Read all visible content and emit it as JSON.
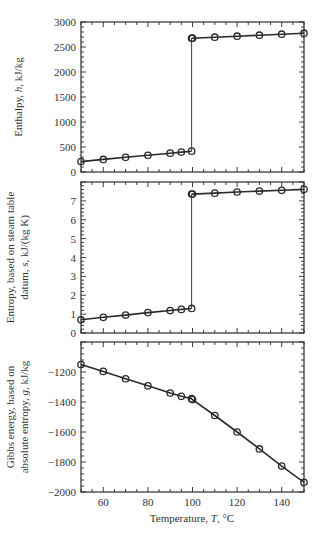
{
  "figure": {
    "xlabel": "Temperature, T, °C",
    "xlabel_parts": [
      "Temperature, ",
      "T",
      ", °C"
    ]
  },
  "chart_data": [
    {
      "type": "line",
      "title": "",
      "xlabel": "",
      "ylabel": "Enthalpy, h, kJ/kg",
      "ylabel_lines": [
        [
          "Enthalpy, ",
          "h",
          ", kJ/kg"
        ]
      ],
      "xlim": [
        50,
        150
      ],
      "ylim": [
        0,
        3000
      ],
      "yticks": [
        0,
        500,
        1000,
        1500,
        2000,
        2500,
        3000
      ],
      "xticks": [
        60,
        80,
        100,
        120,
        140
      ],
      "show_xticklabels": false,
      "grid": false,
      "marker": "open-circle",
      "series": [
        {
          "name": "liquid",
          "x": [
            50,
            60,
            70,
            80,
            90,
            95,
            99.6
          ],
          "y": [
            209,
            251,
            293,
            335,
            377,
            398,
            417
          ]
        },
        {
          "name": "transition",
          "x": [
            99.6,
            99.6
          ],
          "y": [
            417,
            2675
          ],
          "marker": "none",
          "thin": true
        },
        {
          "name": "vapor",
          "x": [
            99.6,
            100,
            110,
            120,
            130,
            140,
            150
          ],
          "y": [
            2675,
            2676,
            2696,
            2716,
            2736,
            2756,
            2776
          ]
        }
      ]
    },
    {
      "type": "line",
      "title": "",
      "xlabel": "",
      "ylabel": "Entropy, based on steam table datum, s, kJ/(kg K)",
      "ylabel_lines": [
        [
          "Entropy, based on steam table"
        ],
        [
          "datum, ",
          "s",
          ", kJ/(kg K)"
        ]
      ],
      "xlim": [
        50,
        150
      ],
      "ylim": [
        0,
        8
      ],
      "yticks": [
        0,
        1,
        2,
        3,
        4,
        5,
        6,
        7
      ],
      "xticks": [
        60,
        80,
        100,
        120,
        140
      ],
      "show_xticklabels": false,
      "grid": false,
      "marker": "open-circle",
      "series": [
        {
          "name": "liquid",
          "x": [
            50,
            60,
            70,
            80,
            90,
            95,
            99.6
          ],
          "y": [
            0.7,
            0.83,
            0.95,
            1.08,
            1.19,
            1.25,
            1.3
          ]
        },
        {
          "name": "transition",
          "x": [
            99.6,
            99.6
          ],
          "y": [
            1.3,
            7.36
          ],
          "marker": "none",
          "thin": true
        },
        {
          "name": "vapor",
          "x": [
            99.6,
            100,
            110,
            120,
            130,
            140,
            150
          ],
          "y": [
            7.36,
            7.36,
            7.41,
            7.47,
            7.52,
            7.56,
            7.61
          ]
        }
      ]
    },
    {
      "type": "line",
      "title": "",
      "xlabel": "Temperature, T, °C",
      "ylabel": "Gibbs energy, based on absolute entropy, g, kJ/kg",
      "ylabel_lines": [
        [
          "Gibbs energy, based on"
        ],
        [
          "absolute entropy, ",
          "g",
          ", kJ/kg"
        ]
      ],
      "xlim": [
        50,
        150
      ],
      "ylim": [
        -2000,
        -1000
      ],
      "yticks": [
        -2000,
        -1800,
        -1600,
        -1400,
        -1200
      ],
      "ytick_labels": [
        "−2000",
        "−1800",
        "−1600",
        "−1400",
        "−1200"
      ],
      "xticks": [
        60,
        80,
        100,
        120,
        140
      ],
      "show_xticklabels": true,
      "grid": false,
      "marker": "open-circle",
      "series": [
        {
          "name": "gibbs",
          "x": [
            50,
            60,
            70,
            80,
            90,
            95,
            99.6,
            100,
            110,
            120,
            130,
            140,
            150
          ],
          "y": [
            -1150,
            -1196,
            -1245,
            -1292,
            -1340,
            -1362,
            -1378,
            -1384,
            -1490,
            -1600,
            -1713,
            -1827,
            -1935
          ]
        }
      ]
    }
  ]
}
